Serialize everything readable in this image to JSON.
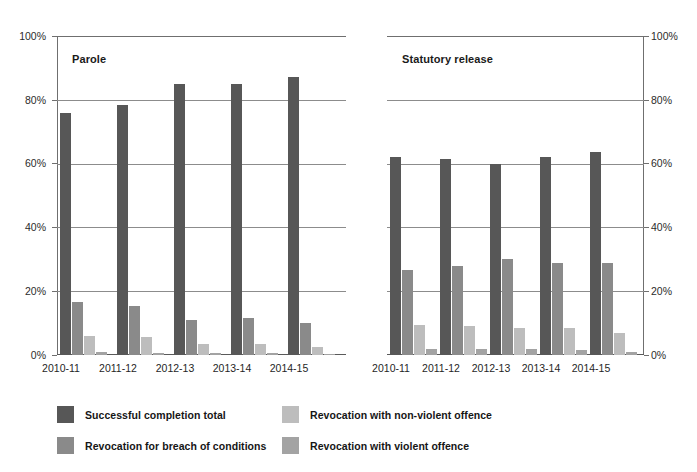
{
  "figure": {
    "width": 697,
    "height": 472,
    "background": "#ffffff"
  },
  "series_colors": {
    "successful_completion_total": "#575757",
    "revocation_for_breach_of_conditions": "#8a8a8a",
    "revocation_with_non_violent_offence": "#bdbdbd",
    "revocation_with_violent_offence": "#a3a3a3"
  },
  "yaxis": {
    "ticks": [
      "0%",
      "20%",
      "40%",
      "60%",
      "80%",
      "100%"
    ],
    "tick_values": [
      0,
      20,
      40,
      60,
      80,
      100
    ],
    "min": 0,
    "max": 100
  },
  "legend": {
    "items": [
      {
        "label": "Successful completion total",
        "color": "#575757"
      },
      {
        "label": "Revocation for breach of conditions",
        "color": "#8a8a8a"
      },
      {
        "label": "Revocation with non-violent offence",
        "color": "#bdbdbd"
      },
      {
        "label": "Revocation with violent offence",
        "color": "#a3a3a3"
      }
    ]
  },
  "chart_data": [
    {
      "type": "bar",
      "title": "Parole",
      "panel": "left",
      "xlabel": "",
      "ylabel": "",
      "ylim": [
        0,
        100
      ],
      "yticks": [
        0,
        20,
        40,
        60,
        80,
        100
      ],
      "ytick_labels": [
        "0%",
        "20%",
        "40%",
        "60%",
        "80%",
        "100%"
      ],
      "grid": true,
      "legend_position": "bottom",
      "categories": [
        "2010-11",
        "2011-12",
        "2012-13",
        "2013-14",
        "2014-15"
      ],
      "series": [
        {
          "name": "Successful completion total",
          "color": "#575757",
          "values": [
            76.0,
            78.5,
            85.0,
            85.0,
            87.0
          ]
        },
        {
          "name": "Revocation for breach of conditions",
          "color": "#8a8a8a",
          "values": [
            16.5,
            15.5,
            11.0,
            11.5,
            10.0
          ]
        },
        {
          "name": "Revocation with non-violent offence",
          "color": "#bdbdbd",
          "values": [
            6.0,
            5.5,
            3.5,
            3.5,
            2.5
          ]
        },
        {
          "name": "Revocation with violent offence",
          "color": "#a3a3a3",
          "values": [
            1.0,
            0.6,
            0.6,
            0.6,
            0.4
          ]
        }
      ]
    },
    {
      "type": "bar",
      "title": "Statutory release",
      "panel": "right",
      "xlabel": "",
      "ylabel": "",
      "ylim": [
        0,
        100
      ],
      "yticks": [
        0,
        20,
        40,
        60,
        80,
        100
      ],
      "ytick_labels": [
        "0%",
        "20%",
        "40%",
        "60%",
        "80%",
        "100%"
      ],
      "grid": true,
      "legend_position": "bottom",
      "categories": [
        "2010-11",
        "2011-12",
        "2012-13",
        "2013-14",
        "2014-15"
      ],
      "series": [
        {
          "name": "Successful completion total",
          "color": "#575757",
          "values": [
            62.0,
            61.5,
            60.0,
            62.0,
            63.5
          ]
        },
        {
          "name": "Revocation for breach of conditions",
          "color": "#8a8a8a",
          "values": [
            26.5,
            28.0,
            30.0,
            29.0,
            29.0
          ]
        },
        {
          "name": "Revocation with non-violent offence",
          "color": "#bdbdbd",
          "values": [
            9.5,
            9.0,
            8.5,
            8.5,
            7.0
          ]
        },
        {
          "name": "Revocation with violent offence",
          "color": "#a3a3a3",
          "values": [
            2.0,
            2.0,
            2.0,
            1.5,
            1.0
          ]
        }
      ]
    }
  ]
}
